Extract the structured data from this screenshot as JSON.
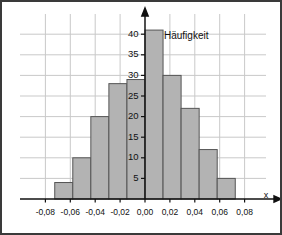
{
  "chart_data": {
    "type": "bar",
    "title": "",
    "subtitle": "",
    "series_label": "Häufigkeit",
    "xlabel": "x",
    "ylabel": "",
    "grid": true,
    "legend_position": "inside-top-right",
    "bin_width": 0.0145,
    "bin_starts": [
      -0.0725,
      -0.058,
      -0.0435,
      -0.029,
      -0.0145,
      0.0,
      0.0145,
      0.029,
      0.0435,
      0.058
    ],
    "bin_centers": [
      -0.065,
      -0.051,
      -0.036,
      -0.022,
      -0.007,
      0.007,
      0.022,
      0.036,
      0.051,
      0.065
    ],
    "categories": [
      "-0,0725",
      "-0,0580",
      "-0,0435",
      "-0,0290",
      "-0,0145",
      "0,0000",
      "0,0145",
      "0,0290",
      "0,0435",
      "0,0580"
    ],
    "values": [
      4,
      10,
      20,
      28,
      29,
      41,
      30,
      22,
      12,
      5
    ],
    "xlim": [
      -0.09,
      0.09
    ],
    "ylim": [
      0,
      44
    ],
    "xticks": [
      -0.08,
      -0.06,
      -0.04,
      -0.02,
      0.0,
      0.02,
      0.04,
      0.06,
      0.08
    ],
    "xticklabels": [
      "-0,08",
      "-0,06",
      "-0,04",
      "-0,02",
      "0,00",
      "0,02",
      "0,04",
      "0,06",
      "0,08"
    ],
    "yticks": [
      5,
      10,
      15,
      20,
      25,
      30,
      35,
      40
    ],
    "yticklabels": [
      "5",
      "10",
      "15",
      "20",
      "25",
      "30",
      "35",
      "40"
    ],
    "colors": {
      "bar_fill": "#b3b3b3",
      "bar_stroke": "#555555",
      "grid": "#c9c9c9",
      "axis": "#111111",
      "frame_border": "#3a3a3a",
      "background": "#ffffff"
    }
  }
}
